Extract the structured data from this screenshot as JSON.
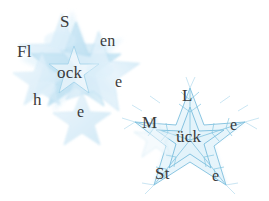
{
  "image": {
    "kind": "captcha-distorted-text",
    "width": 269,
    "height": 201,
    "background_color": "#ffffff"
  },
  "palette": {
    "text_color": "#3b3b3b",
    "star_fill_light": "#e4f2fa",
    "star_fill_mid": "#cde7f5",
    "star_fill_deep": "#b6dcef",
    "star_stroke": "#8fc9e4",
    "snowflake_stroke": "#7fc0de"
  },
  "artwork": {
    "left_cluster_name": "watercolor-star-cluster",
    "right_cluster_name": "line-snowflake-star"
  },
  "glyphs": [
    {
      "id": "g-Fl",
      "text": "Fl",
      "name": "captcha-glyph-fl",
      "cluster": "left",
      "x": 17,
      "y": 43
    },
    {
      "id": "g-S",
      "text": "S",
      "name": "captcha-glyph-s",
      "cluster": "left",
      "x": 60,
      "y": 13
    },
    {
      "id": "g-en",
      "text": "en",
      "name": "captcha-glyph-en",
      "cluster": "left",
      "x": 100,
      "y": 33
    },
    {
      "id": "g-ock",
      "text": "ock",
      "name": "captcha-glyph-ock",
      "cluster": "left",
      "x": 57,
      "y": 64
    },
    {
      "id": "g-e1",
      "text": "e",
      "name": "captcha-glyph-e-1",
      "cluster": "left",
      "x": 115,
      "y": 74
    },
    {
      "id": "g-h",
      "text": "h",
      "name": "captcha-glyph-h",
      "cluster": "left",
      "x": 33,
      "y": 91
    },
    {
      "id": "g-e2",
      "text": "e",
      "name": "captcha-glyph-e-2",
      "cluster": "left",
      "x": 77,
      "y": 104
    },
    {
      "id": "g-L",
      "text": "L",
      "name": "captcha-glyph-l",
      "cluster": "right",
      "x": 182,
      "y": 87
    },
    {
      "id": "g-M",
      "text": "M",
      "name": "captcha-glyph-m",
      "cluster": "right",
      "x": 142,
      "y": 114
    },
    {
      "id": "g-uck",
      "text": "ück",
      "name": "captcha-glyph-ueck",
      "cluster": "right",
      "x": 176,
      "y": 128
    },
    {
      "id": "g-e3",
      "text": "e",
      "name": "captcha-glyph-e-3",
      "cluster": "right",
      "x": 230,
      "y": 117
    },
    {
      "id": "g-St",
      "text": "St",
      "name": "captcha-glyph-st",
      "cluster": "right",
      "x": 155,
      "y": 165
    },
    {
      "id": "g-e4",
      "text": "e",
      "name": "captcha-glyph-e-4",
      "cluster": "right",
      "x": 212,
      "y": 168
    }
  ]
}
